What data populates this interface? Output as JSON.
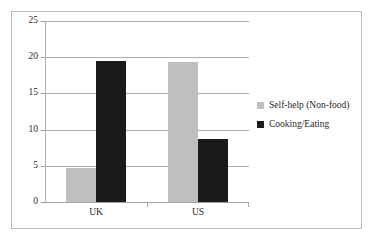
{
  "chart_data": {
    "type": "bar",
    "title": "",
    "xlabel": "",
    "ylabel": "",
    "categories": [
      "UK",
      "US"
    ],
    "ylim": [
      0,
      25
    ],
    "yticks": [
      0,
      5,
      10,
      15,
      20,
      25
    ],
    "ytick_labels": [
      "0",
      "5",
      "10",
      "15",
      "20",
      "25"
    ],
    "grid": true,
    "legend_position": "right",
    "series": [
      {
        "name": "Self-help (Non-food)",
        "color": "#bfbfbf",
        "values": [
          4.7,
          19.3
        ]
      },
      {
        "name": "Cooking/Eating",
        "color": "#1b1b1b",
        "values": [
          19.5,
          8.7
        ]
      }
    ]
  },
  "legend": {
    "items": [
      {
        "label": "Self-help (Non-food)"
      },
      {
        "label": "Cooking/Eating"
      }
    ]
  }
}
